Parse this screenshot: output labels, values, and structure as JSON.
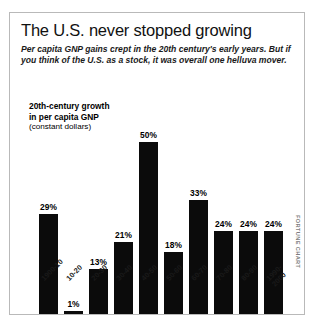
{
  "chart_data": {
    "type": "bar",
    "title": "The U.S. never stopped growing",
    "subtitle": "Per capita GNP gains crept in the 20th century's early years. But if you think of the U.S. as a stock, it was overall one helluva mover.",
    "series_caption": {
      "line1": "20th-century growth",
      "line2": "in per capita GNP",
      "line3": "(constant dollars)"
    },
    "categories": [
      "1900-10",
      "10-20",
      "20-30",
      "30-40",
      "40-50",
      "50-60",
      "60-70",
      "70-80",
      "80-90",
      "1990-\n2000"
    ],
    "values": [
      29,
      1,
      13,
      21,
      50,
      18,
      33,
      24,
      24,
      24
    ],
    "value_labels": [
      "29%",
      "1%",
      "13%",
      "21%",
      "50%",
      "18%",
      "33%",
      "24%",
      "24%",
      "24%"
    ],
    "xlabel": "",
    "ylabel": "",
    "ylim": [
      0,
      50
    ],
    "grid": false,
    "legend": "none",
    "bar_color": "#0b0b0b",
    "credit": "FORTUNE CHART"
  }
}
